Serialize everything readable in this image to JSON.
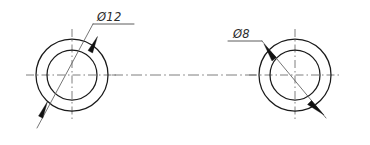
{
  "drawing": {
    "title": "Two-hole concentric ring detail",
    "background_color": "#ffffff",
    "line_color": "#1a1a1a",
    "centerline_color": "#6f6f6f",
    "leader_color": "#5d5d5d",
    "width": 370,
    "height": 145
  },
  "features": [
    {
      "id": "left-ring",
      "name": "left-circle-assembly",
      "center_x": 72,
      "center_y": 75,
      "outer_radius": 36,
      "inner_radius": 25,
      "dimension_label": "Ø12",
      "label_x": 97,
      "label_y": 21,
      "leader_shelf_x1": 93,
      "leader_shelf_x2": 133,
      "leader_shelf_y": 24,
      "leader_x1": 37,
      "leader_y1": 128,
      "leader_x2": 93,
      "leader_y2": 24,
      "arrow_1_x": 96,
      "arrow_1_y": 40,
      "arrow_2_x": 45,
      "arrow_2_y": 110,
      "hatch_marks": 2
    },
    {
      "id": "right-ring",
      "name": "right-circle-assembly",
      "center_x": 295,
      "center_y": 75,
      "outer_radius": 36,
      "inner_radius": 25,
      "dimension_label": "Ø8",
      "label_x": 233,
      "label_y": 38,
      "leader_shelf_x1": 228,
      "leader_shelf_x2": 262,
      "leader_shelf_y": 41,
      "leader_x1": 262,
      "leader_y1": 41,
      "leader_x2": 325,
      "leader_y2": 117,
      "arrow_1_x": 270,
      "arrow_1_y": 50,
      "arrow_2_x": 318,
      "arrow_2_y": 108,
      "hatch_marks": 2
    }
  ],
  "centerlines": {
    "axis_label": "horizontal-axis-centerline",
    "axis_y": 75,
    "axis_x1": 14,
    "axis_x2": 356,
    "vertical_label": "vertical-centerline"
  }
}
